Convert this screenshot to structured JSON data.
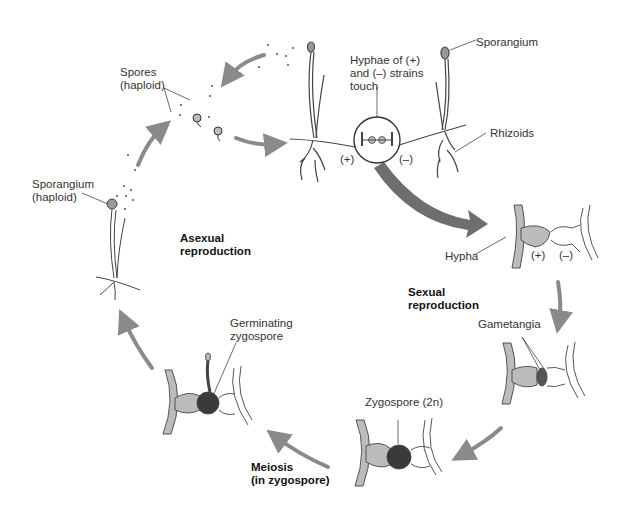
{
  "colors": {
    "arrow": "#8a8a8a",
    "big_arrow": "#6e6e6e",
    "hypha_plus": "#bcbcbc",
    "zygospore": "#3a3a3a",
    "outline": "#333333",
    "text": "#333333"
  },
  "labels": {
    "spores": "Spores\n(haploid)",
    "sporangium_left": "Sporangium\n(haploid)",
    "sporangium_top": "Sporangium",
    "hyphae_touch": "Hyphae of (+)\nand (–) strains\ntouch",
    "rhizoids": "Rhizoids",
    "plus_strain": "(+)",
    "minus_strain": "(–)",
    "hypha": "Hypha",
    "hypha_plus": "(+)",
    "hypha_minus": "(–)",
    "gametangia": "Gametangia",
    "zygospore": "Zygospore (2n)",
    "germinating_zygospore": "Germinating\nzygospore"
  },
  "stages": {
    "asexual": "Asexual\nreproduction",
    "sexual": "Sexual\nreproduction",
    "meiosis": "Meiosis\n(in zygospore)"
  }
}
